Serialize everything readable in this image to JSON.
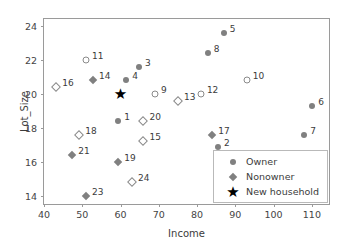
{
  "chart_data": {
    "type": "scatter",
    "title": "",
    "xlabel": "Income",
    "ylabel": "Lot_Size",
    "xlim": [
      40,
      115
    ],
    "ylim": [
      13.4,
      24.4
    ],
    "xticks": [
      40,
      50,
      60,
      70,
      80,
      90,
      100,
      110
    ],
    "yticks": [
      14,
      16,
      18,
      20,
      22,
      24
    ],
    "grid": false,
    "legend_position": "lower right",
    "colors": {
      "owner": "#808080",
      "nonowner": "#808080",
      "new_household": "#000000",
      "axis": "#9a9a9a",
      "text": "#3b3b3b"
    },
    "legend": [
      {
        "label": "Owner",
        "marker": "circle"
      },
      {
        "label": "Nonowner",
        "marker": "diamond"
      },
      {
        "label": "New household",
        "marker": "star"
      }
    ],
    "series": [
      {
        "name": "Owner",
        "marker": "circle-filled",
        "points": [
          {
            "label": "1",
            "x": 59.4,
            "y": 18.4,
            "lx": 6,
            "ly": -4
          },
          {
            "label": "2",
            "x": 85.5,
            "y": 16.85,
            "lx": 6,
            "ly": -4
          },
          {
            "label": "3",
            "x": 64.8,
            "y": 21.6,
            "lx": 6,
            "ly": -4
          },
          {
            "label": "4",
            "x": 61.5,
            "y": 20.8,
            "lx": 6,
            "ly": -4
          },
          {
            "label": "5",
            "x": 87.0,
            "y": 23.6,
            "lx": 6,
            "ly": -4
          },
          {
            "label": "6",
            "x": 110.1,
            "y": 19.3,
            "lx": 6,
            "ly": -4
          },
          {
            "label": "7",
            "x": 108.0,
            "y": 17.6,
            "lx": 6,
            "ly": -4
          },
          {
            "label": "8",
            "x": 82.8,
            "y": 22.4,
            "lx": 6,
            "ly": -4
          }
        ]
      },
      {
        "name": "Owner-open",
        "marker": "circle-open",
        "points": [
          {
            "label": "9",
            "x": 69.0,
            "y": 20.0,
            "lx": 6,
            "ly": -4
          },
          {
            "label": "10",
            "x": 93.0,
            "y": 20.8,
            "lx": 6,
            "ly": -4
          },
          {
            "label": "11",
            "x": 51.0,
            "y": 22.0,
            "lx": 6,
            "ly": -4
          },
          {
            "label": "12",
            "x": 81.0,
            "y": 20.0,
            "lx": 6,
            "ly": -4
          }
        ]
      },
      {
        "name": "Nonowner",
        "marker": "diamond-filled",
        "points": [
          {
            "label": "14",
            "x": 52.8,
            "y": 20.8,
            "lx": 6,
            "ly": -4
          },
          {
            "label": "17",
            "x": 84.0,
            "y": 17.6,
            "lx": 6,
            "ly": -4
          },
          {
            "label": "19",
            "x": 59.4,
            "y": 16.0,
            "lx": 6,
            "ly": -4
          },
          {
            "label": "21",
            "x": 47.4,
            "y": 16.4,
            "lx": 6,
            "ly": -4
          },
          {
            "label": "23",
            "x": 51.0,
            "y": 14.0,
            "lx": 6,
            "ly": -4
          }
        ]
      },
      {
        "name": "Nonowner-open",
        "marker": "diamond-open",
        "points": [
          {
            "label": "13",
            "x": 75.0,
            "y": 19.6,
            "lx": 6,
            "ly": -4
          },
          {
            "label": "15",
            "x": 66.0,
            "y": 17.2,
            "lx": 6,
            "ly": -4
          },
          {
            "label": "16",
            "x": 43.2,
            "y": 20.4,
            "lx": 6,
            "ly": -4
          },
          {
            "label": "18",
            "x": 49.2,
            "y": 17.6,
            "lx": 6,
            "ly": -4
          },
          {
            "label": "20",
            "x": 66.0,
            "y": 18.4,
            "lx": 6,
            "ly": -4
          },
          {
            "label": "24",
            "x": 63.0,
            "y": 14.8,
            "lx": 6,
            "ly": -4
          }
        ]
      },
      {
        "name": "New household",
        "marker": "star",
        "points": [
          {
            "label": "",
            "x": 60.0,
            "y": 20.0,
            "lx": 0,
            "ly": 0
          }
        ]
      }
    ]
  }
}
